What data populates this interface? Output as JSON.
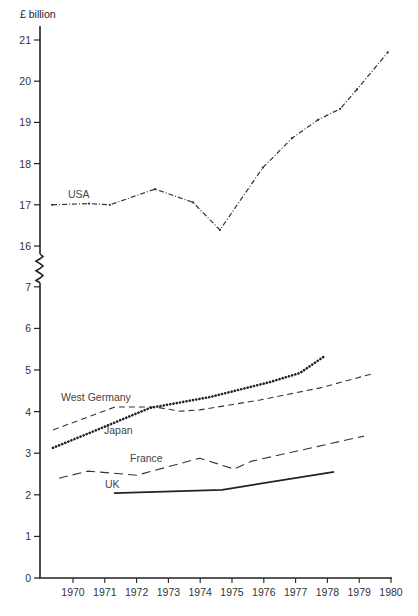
{
  "chart_data": {
    "type": "line",
    "title": "",
    "ylabel": "£ billion",
    "xlabel": "",
    "y_axis_break": {
      "lower_range": [
        0,
        7
      ],
      "upper_range": [
        16,
        21
      ]
    },
    "yticks_lower": [
      "0",
      "1",
      "2",
      "3",
      "4",
      "5",
      "6",
      "7"
    ],
    "yticks_upper": [
      "16",
      "17",
      "18",
      "19",
      "20",
      "21"
    ],
    "xticks": [
      "1970",
      "1971",
      "1972",
      "1973",
      "1974",
      "1975",
      "1976",
      "1977",
      "1978",
      "1979",
      "1980"
    ],
    "xlim": [
      1969.0,
      1980.0
    ],
    "grid": false,
    "legend": "inline labels",
    "series": [
      {
        "name": "USA",
        "style": "dash-dot",
        "x": [
          1969.34,
          1970.5,
          1971.16,
          1972.58,
          1973.77,
          1974.62,
          1975.97,
          1976.89,
          1977.7,
          1978.4,
          1978.93,
          1979.9
        ],
        "y": [
          17.0,
          17.03,
          17.0,
          17.38,
          17.06,
          16.39,
          17.9,
          18.62,
          19.06,
          19.33,
          19.8,
          20.7
        ]
      },
      {
        "name": "West Germany",
        "style": "dashed",
        "x": [
          1969.37,
          1971.32,
          1972.58,
          1973.36,
          1973.99,
          1975.88,
          1977.77,
          1979.37
        ],
        "y": [
          3.56,
          4.11,
          4.11,
          4.01,
          4.04,
          4.28,
          4.57,
          4.9
        ]
      },
      {
        "name": "Japan",
        "style": "dotted",
        "x": [
          1969.37,
          1970.53,
          1972.42,
          1974.31,
          1976.19,
          1977.14,
          1977.92
        ],
        "y": [
          3.13,
          3.49,
          4.09,
          4.35,
          4.71,
          4.93,
          5.34
        ]
      },
      {
        "name": "France",
        "style": "long-dashed",
        "x": [
          1969.56,
          1970.47,
          1972.01,
          1973.99,
          1975.06,
          1975.63,
          1979.15
        ],
        "y": [
          2.4,
          2.57,
          2.47,
          2.88,
          2.62,
          2.81,
          3.41
        ]
      },
      {
        "name": "UK",
        "style": "solid",
        "x": [
          1971.29,
          1974.69,
          1978.21
        ],
        "y": [
          2.04,
          2.12,
          2.55
        ]
      }
    ],
    "annotations": [
      {
        "text": "USA",
        "series": "USA"
      },
      {
        "text": "West Germany",
        "series": "West Germany"
      },
      {
        "text": "Japan",
        "series": "Japan"
      },
      {
        "text": "France",
        "series": "France"
      },
      {
        "text": "UK",
        "series": "UK"
      }
    ]
  }
}
